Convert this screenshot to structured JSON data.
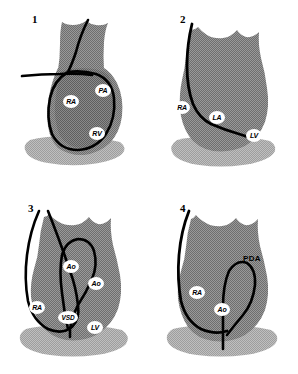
{
  "figure": {
    "panel_count": 4,
    "colors": {
      "background": "#ffffff",
      "heart_fill": "#8f8f8f",
      "heart_fill_light": "#b4b4b4",
      "heart_fill_dark": "#7d7d7d",
      "catheter": "#000000",
      "label_bg": "#ffffff",
      "label_text": "#000000"
    }
  },
  "panels": [
    {
      "number": "1",
      "labels": [
        {
          "text": "RA",
          "name": "right-atrium"
        },
        {
          "text": "PA",
          "name": "pulmonary-artery"
        },
        {
          "text": "RV",
          "name": "right-ventricle"
        }
      ]
    },
    {
      "number": "2",
      "labels": [
        {
          "text": "RA",
          "name": "right-atrium"
        },
        {
          "text": "LA",
          "name": "left-atrium"
        },
        {
          "text": "LV",
          "name": "left-ventricle"
        }
      ]
    },
    {
      "number": "3",
      "labels": [
        {
          "text": "Ao",
          "name": "aorta-upper"
        },
        {
          "text": "Ao",
          "name": "aorta-lower"
        },
        {
          "text": "RA",
          "name": "right-atrium"
        },
        {
          "text": "VSD",
          "name": "ventricular-septal-defect"
        },
        {
          "text": "LV",
          "name": "left-ventricle"
        }
      ]
    },
    {
      "number": "4",
      "labels": [
        {
          "text": "RA",
          "name": "right-atrium"
        },
        {
          "text": "Ao",
          "name": "aorta"
        },
        {
          "text": "PDA",
          "name": "patent-ductus-arteriosus"
        }
      ]
    }
  ]
}
